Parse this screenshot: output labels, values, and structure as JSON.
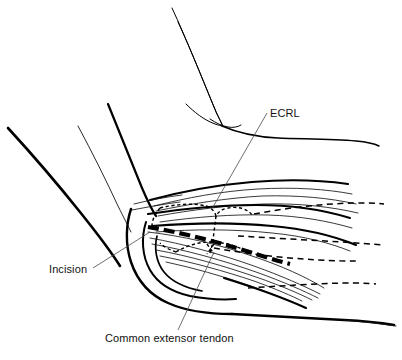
{
  "figure": {
    "type": "line-drawing",
    "background_color": "#ffffff",
    "ink_color": "#000000",
    "width": 402,
    "height": 360
  },
  "annotations": [
    {
      "id": "ecrl",
      "label": "ECRL",
      "meaning": "Extensor carpi radialis longus",
      "text_x": 270,
      "text_y": 117,
      "leader_from": [
        267,
        113
      ],
      "leader_to": [
        213,
        207
      ]
    },
    {
      "id": "incision",
      "label": "Incision",
      "meaning": "Planned skin incision line",
      "text_x": 49,
      "text_y": 273,
      "leader_from": [
        93,
        268
      ],
      "leader_to": [
        150,
        232
      ]
    },
    {
      "id": "common-extensor-tendon",
      "label": "Common extensor tendon",
      "meaning": "Common extensor tendon origin",
      "text_x": 105,
      "text_y": 342,
      "leader_from": [
        178,
        330
      ],
      "leader_to": [
        214,
        252
      ]
    }
  ],
  "legend_notes": {
    "solid_lines": "Skin contour and superficial muscle fibers",
    "heavy_dashed_line": "Incision line",
    "fine_dashed_lines": "Deep / hidden structures",
    "dotted_outline": "ECRL muscle belly border"
  },
  "watermark": {
    "visible": true,
    "text": "",
    "x": 300,
    "y": 30
  }
}
